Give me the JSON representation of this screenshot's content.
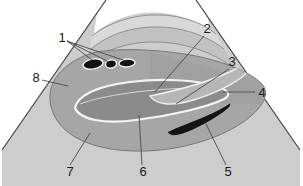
{
  "figure": {
    "type": "grayscale-line-illustration",
    "width": 303,
    "height": 186,
    "background_color": "#ffffff"
  },
  "palette": {
    "background": "#ffffff",
    "outline": "#3a3a3a",
    "leader_line": "#555555",
    "sector_band_light": "#d8d8d8",
    "sector_band_mid": "#c6c6c6",
    "organ_body": "#a9a9a9",
    "organ_body_dark": "#9d9d9d",
    "lumen_fill": "#8a8a8a",
    "lumen_outline": "#f2f2f2",
    "void_dark": "#1a1a1a",
    "label_text": "#1a1a1a"
  },
  "labels": [
    {
      "id": "1",
      "text": "1",
      "x": 62,
      "y": 42,
      "anchor": "middle"
    },
    {
      "id": "2",
      "text": "2",
      "x": 207,
      "y": 33,
      "anchor": "middle"
    },
    {
      "id": "3",
      "text": "3",
      "x": 232,
      "y": 66,
      "anchor": "middle"
    },
    {
      "id": "4",
      "text": "4",
      "x": 262,
      "y": 93,
      "anchor": "middle"
    },
    {
      "id": "5",
      "text": "5",
      "x": 228,
      "y": 172,
      "anchor": "middle"
    },
    {
      "id": "6",
      "text": "6",
      "x": 143,
      "y": 172,
      "anchor": "middle"
    },
    {
      "id": "7",
      "text": "7",
      "x": 70,
      "y": 172,
      "anchor": "middle"
    },
    {
      "id": "8",
      "text": "8",
      "x": 36,
      "y": 82,
      "anchor": "middle"
    }
  ],
  "leader_lines": [
    {
      "for": "1",
      "path": "M 67 41 L 92 60"
    },
    {
      "for": "1",
      "path": "M 67 41 L 109 62"
    },
    {
      "for": "1",
      "path": "M 67 41 L 126 61"
    },
    {
      "for": "2",
      "path": "M 204 36 L 155 92"
    },
    {
      "for": "3",
      "path": "M 229 69 L 176 104"
    },
    {
      "for": "4",
      "path": "M 255 92 L 223 92"
    },
    {
      "for": "5",
      "path": "M 226 165 L 205 122"
    },
    {
      "for": "6",
      "path": "M 142 165 L 139 115"
    },
    {
      "for": "7",
      "path": "M 70 165 L 90 133"
    },
    {
      "for": "8",
      "path": "M 42 80 L 68 86"
    }
  ],
  "sector": {
    "name": "ultrasound-sector-fan",
    "apex_left_x": 106,
    "apex_right_x": 196,
    "left_edge_path": "M 106 0 L 2 150",
    "right_edge_path": "M 196 0 L 300 150"
  },
  "shapes": [
    {
      "name": "sector-outer-fan",
      "role": "scan-field"
    },
    {
      "name": "sector-arc-band-upper",
      "role": "near-field-band"
    },
    {
      "name": "sector-arc-band-lower",
      "role": "tissue-band"
    },
    {
      "name": "organ-body",
      "role": "main-organ-mass"
    },
    {
      "name": "central-lumen",
      "role": "central-elongated-lumen"
    },
    {
      "name": "tapered-duct",
      "role": "tapering-duct"
    },
    {
      "name": "vessel-oval-left",
      "role": "anechoic-vessel-1"
    },
    {
      "name": "vessel-oval-mid",
      "role": "anechoic-vessel-2"
    },
    {
      "name": "vessel-oval-right",
      "role": "anechoic-vessel-3"
    },
    {
      "name": "dark-comma-structure",
      "role": "anechoic-comma-structure"
    }
  ]
}
